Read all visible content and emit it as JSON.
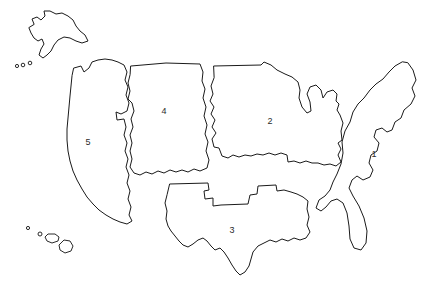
{
  "map": {
    "title": "United States Regions Outline Map",
    "style": {
      "background_color": "#ffffff",
      "outline_color": "#1a1a1a",
      "label_color": "#2b2b2b",
      "fill_color": "#ffffff"
    },
    "regions": [
      {
        "id": "region-1",
        "label": "1",
        "name": "east-coast-region",
        "label_x": 374,
        "label_y": 155,
        "outline": "M 408 63 L 413 70 L 416 80 L 412 88 L 415 96 L 411 104 L 404 110 L 401 118 L 395 122 L 392 130 L 387 132 L 382 128 L 376 130 L 374 137 L 379 143 L 377 151 L 371 155 L 369 163 L 373 170 L 370 177 L 363 180 L 357 176 L 352 180 L 349 188 L 353 196 L 359 206 L 364 218 L 367 231 L 366 243 L 361 250 L 354 248 L 350 239 L 349 226 L 347 213 L 343 203 L 337 199 L 331 201 L 326 207 L 321 211 L 316 208 L 319 200 L 325 196 L 330 190 L 333 182 L 337 174 L 341 164 L 343 153 L 342 142 L 345 131 L 350 122 L 353 112 L 358 104 L 364 98 L 370 90 L 376 84 L 383 79 L 389 72 L 395 66 L 402 62 Z"
      },
      {
        "id": "region-2",
        "label": "2",
        "name": "midwest-region",
        "label_x": 270,
        "label_y": 122,
        "outline": "M 214 66 L 261 65 L 264 62 L 271 65 L 277 70 L 285 74 L 292 77 L 298 82 L 300 90 L 299 98 L 302 107 L 307 113 L 311 111 L 310 102 L 307 94 L 310 87 L 316 85 L 321 90 L 323 98 L 327 92 L 333 90 L 337 94 L 336 101 L 339 104 L 337 110 L 340 115 L 343 123 L 341 131 L 342 140 L 338 143 L 341 149 L 338 155 L 341 162 L 336 166 L 330 164 L 324 165 L 318 163 L 312 163 L 306 161 L 300 163 L 294 161 L 288 162 L 287 155 L 281 153 L 275 155 L 269 153 L 263 155 L 257 154 L 251 156 L 245 155 L 239 157 L 233 155 L 228 158 L 222 156 L 219 148 L 214 147 L 212 139 L 216 133 L 212 127 L 215 120 L 211 114 L 214 107 L 210 101 L 213 94 L 211 86 L 214 78 Z"
      },
      {
        "id": "region-3",
        "label": "3",
        "name": "south-region",
        "label_x": 232,
        "label_y": 231,
        "outline": "M 170 184 L 208 183 L 209 190 L 204 191 L 205 199 L 213 198 L 213 206 L 221 205 L 248 204 L 250 195 L 257 194 L 258 186 L 276 185 L 277 191 L 284 190 L 291 192 L 297 194 L 303 197 L 308 201 L 307 209 L 309 217 L 307 225 L 310 232 L 306 238 L 300 240 L 294 238 L 288 241 L 282 239 L 276 242 L 270 240 L 264 243 L 258 246 L 253 252 L 251 259 L 249 266 L 245 272 L 240 275 L 236 271 L 232 265 L 228 258 L 224 252 L 220 248 L 215 250 L 211 246 L 207 241 L 203 238 L 198 240 L 193 244 L 188 247 L 183 245 L 179 241 L 175 236 L 171 231 L 168 226 L 166 219 L 167 211 L 165 203 L 167 195 Z"
      },
      {
        "id": "region-4",
        "label": "4",
        "name": "mountain-west-region",
        "label_x": 164,
        "label_y": 112,
        "outline": "M 131 66 L 166 63 L 200 64 L 203 72 L 202 81 L 205 89 L 203 98 L 206 107 L 204 116 L 207 125 L 205 134 L 208 142 L 206 151 L 209 160 L 207 168 L 200 171 L 194 169 L 188 172 L 182 170 L 176 172 L 170 170 L 164 173 L 158 171 L 152 174 L 146 172 L 140 175 L 134 173 L 130 167 L 132 159 L 130 151 L 132 143 L 130 135 L 133 127 L 131 119 L 134 111 L 132 103 L 128 99 L 130 91 L 128 83 L 130 75 Z"
      },
      {
        "id": "region-5",
        "label": "5",
        "name": "west-coast-region",
        "label_x": 88,
        "label_y": 143,
        "outline": "M 74 68 L 81 66 L 84 72 L 89 68 L 92 62 L 98 60 L 105 59 L 112 60 L 118 62 L 124 65 L 127 72 L 125 80 L 128 87 L 126 95 L 129 103 L 127 111 L 121 114 L 116 112 L 117 120 L 124 119 L 126 127 L 124 135 L 127 143 L 125 151 L 128 159 L 126 167 L 129 175 L 127 183 L 130 191 L 128 199 L 131 207 L 129 215 L 132 221 L 127 224 L 120 222 L 113 219 L 106 215 L 99 210 L 93 204 L 87 197 L 82 189 L 77 180 L 73 171 L 70 161 L 68 151 L 67 140 L 67 129 L 68 118 L 69 107 L 70 96 L 71 86 L 72 76 Z"
      }
    ],
    "alaska": {
      "name": "alaska-outline",
      "outline": "M 34 24 L 32 19 L 37 17 L 41 20 L 45 16 L 44 11 L 50 11 L 56 14 L 62 13 L 68 16 L 73 20 L 76 26 L 80 31 L 85 35 L 88 41 L 82 43 L 76 41 L 70 38 L 64 37 L 58 40 L 54 45 L 51 51 L 47 55 L 43 58 L 39 55 L 41 49 L 44 44 L 42 39 L 38 41 L 34 38 L 31 33 L 29 28 Z"
    },
    "aleutian_dots": [
      {
        "cx": 17,
        "cy": 66,
        "r": 1.6
      },
      {
        "cx": 23,
        "cy": 65,
        "r": 1.8
      },
      {
        "cx": 30,
        "cy": 63,
        "r": 1.8
      }
    ],
    "hawaii": {
      "name": "hawaii-islands",
      "dots": [
        {
          "cx": 28,
          "cy": 228,
          "r": 1.6
        },
        {
          "cx": 40,
          "cy": 234,
          "r": 2.0
        }
      ],
      "shapes": [
        "M 48 234 L 55 234 L 59 237 L 58 241 L 52 243 L 47 241 L 45 237 Z",
        "M 64 240 L 70 241 L 73 246 L 71 251 L 65 253 L 60 250 L 59 245 Z"
      ]
    }
  }
}
